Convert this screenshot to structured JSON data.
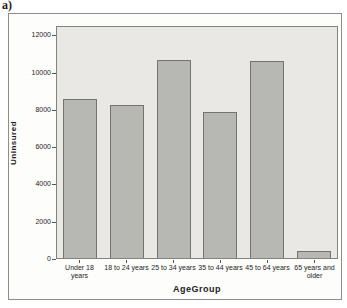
{
  "figure_label": "a)",
  "chart_data": {
    "type": "bar",
    "title": "",
    "categories": [
      "Under 18 years",
      "18 to 24 years",
      "25 to 34 years",
      "35 to 44 years",
      "45 to 64 years",
      "65 years and older"
    ],
    "values": [
      8600,
      8300,
      10700,
      7900,
      10650,
      400
    ],
    "xlabel": "AgeGroup",
    "ylabel": "Uninsured",
    "ylim": [
      0,
      12500
    ],
    "yticks": [
      0,
      2000,
      4000,
      6000,
      8000,
      10000,
      12000
    ],
    "grid": false,
    "legend": "none"
  },
  "colors": {
    "bar_fill": "#b7b7b4",
    "bar_border": "#74746f",
    "plot_bg": "#e9e8e4",
    "plot_border": "#83837e",
    "figure_bg": "#fdfdfb",
    "frame_border": "#8d8d89",
    "axis_line": "#55554f",
    "text": "#1c1c1c"
  }
}
